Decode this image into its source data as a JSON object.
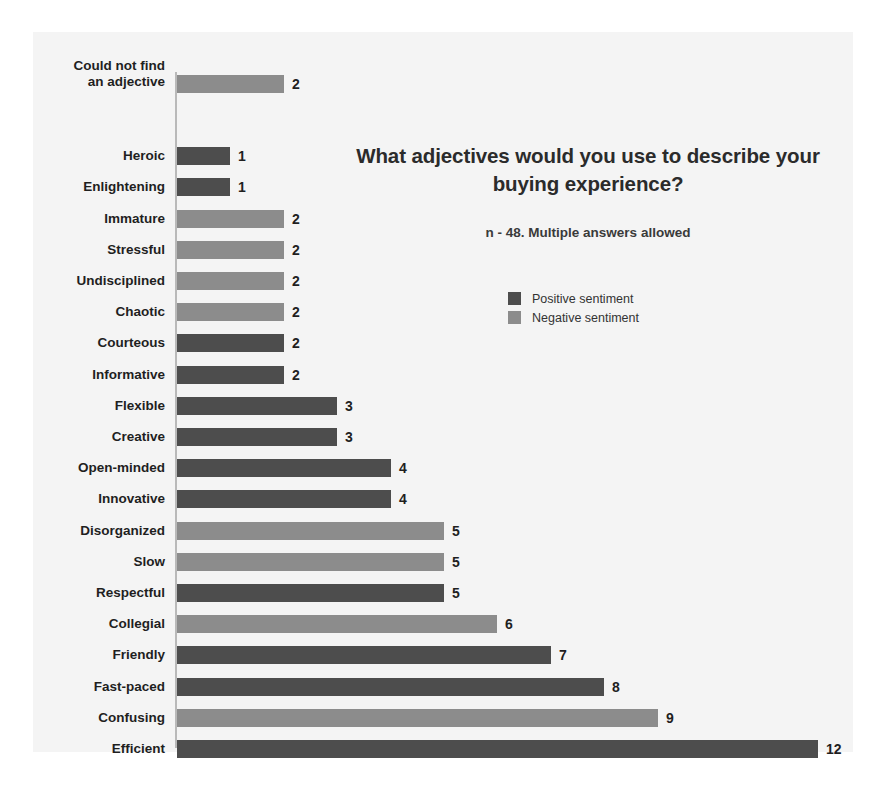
{
  "chart_data": {
    "type": "bar",
    "orientation": "horizontal",
    "title": "What adjectives would you use to describe your buying experience?",
    "subtitle": "n - 48. Multiple answers allowed",
    "xlabel": "",
    "ylabel": "",
    "xlim": [
      0,
      12
    ],
    "grid": false,
    "legend_position": "upper-center",
    "series": [
      {
        "name": "Positive sentiment",
        "color": "#4d4d4d"
      },
      {
        "name": "Negative sentiment",
        "color": "#8c8c8c"
      }
    ],
    "categories": [
      "Could not find an adjective",
      "Heroic",
      "Enlightening",
      "Immature",
      "Stressful",
      "Undisciplined",
      "Chaotic",
      "Courteous",
      "Informative",
      "Flexible",
      "Creative",
      "Open-minded",
      "Innovative",
      "Disorganized",
      "Slow",
      "Respectful",
      "Collegial",
      "Friendly",
      "Fast-paced",
      "Confusing",
      "Efficient"
    ],
    "values": [
      2,
      1,
      1,
      2,
      2,
      2,
      2,
      2,
      2,
      3,
      3,
      4,
      4,
      5,
      5,
      5,
      6,
      7,
      8,
      9,
      12
    ],
    "sentiments": [
      "negative",
      "positive",
      "positive",
      "negative",
      "negative",
      "negative",
      "negative",
      "positive",
      "positive",
      "positive",
      "positive",
      "positive",
      "positive",
      "negative",
      "negative",
      "positive",
      "negative",
      "positive",
      "positive",
      "negative",
      "positive"
    ],
    "bars": [
      {
        "label": "Could not find an adjective",
        "label_line1": "Could not find",
        "label_line2": "an adjective",
        "value": 2,
        "sentiment": "negative"
      },
      {
        "label": "Heroic",
        "value": 1,
        "sentiment": "positive"
      },
      {
        "label": "Enlightening",
        "value": 1,
        "sentiment": "positive"
      },
      {
        "label": "Immature",
        "value": 2,
        "sentiment": "negative"
      },
      {
        "label": "Stressful",
        "value": 2,
        "sentiment": "negative"
      },
      {
        "label": "Undisciplined",
        "value": 2,
        "sentiment": "negative"
      },
      {
        "label": "Chaotic",
        "value": 2,
        "sentiment": "negative"
      },
      {
        "label": "Courteous",
        "value": 2,
        "sentiment": "positive"
      },
      {
        "label": "Informative",
        "value": 2,
        "sentiment": "positive"
      },
      {
        "label": "Flexible",
        "value": 3,
        "sentiment": "positive"
      },
      {
        "label": "Creative",
        "value": 3,
        "sentiment": "positive"
      },
      {
        "label": "Open-minded",
        "value": 4,
        "sentiment": "positive"
      },
      {
        "label": "Innovative",
        "value": 4,
        "sentiment": "positive"
      },
      {
        "label": "Disorganized",
        "value": 5,
        "sentiment": "negative"
      },
      {
        "label": "Slow",
        "value": 5,
        "sentiment": "negative"
      },
      {
        "label": "Respectful",
        "value": 5,
        "sentiment": "positive"
      },
      {
        "label": "Collegial",
        "value": 6,
        "sentiment": "negative"
      },
      {
        "label": "Friendly",
        "value": 7,
        "sentiment": "positive"
      },
      {
        "label": "Fast-paced",
        "value": 8,
        "sentiment": "positive"
      },
      {
        "label": "Confusing",
        "value": 9,
        "sentiment": "negative"
      },
      {
        "label": "Efficient",
        "value": 12,
        "sentiment": "positive"
      }
    ]
  },
  "colors": {
    "positive": "#4d4d4d",
    "negative": "#8c8c8c",
    "axis": "#b9b9b9",
    "panel_background": "#f4f4f4",
    "page_background": "#ffffff",
    "text": "#1f1f1f"
  }
}
